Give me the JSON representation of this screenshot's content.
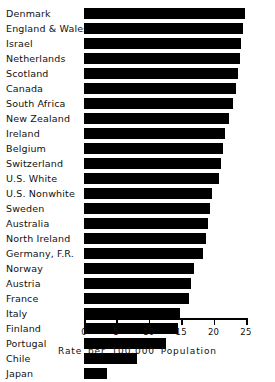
{
  "chart_data": {
    "type": "bar",
    "orientation": "horizontal",
    "title": "",
    "subtitle": "",
    "xlabel": "Rate per 100,000 Population",
    "ylabel": "",
    "xlim": [
      0,
      25
    ],
    "xticks": [
      0,
      5,
      10,
      15,
      20,
      25
    ],
    "xtick_labels": [
      "0",
      "5",
      "10",
      "15",
      "20",
      "25"
    ],
    "grid": false,
    "legend": false,
    "bar_color": "#000000",
    "background_color": "#ffffff",
    "categories": [
      "Denmark",
      "England & Wales",
      "Israel",
      "Netherlands",
      "Scotland",
      "Canada",
      "South  Africa",
      "New  Zealand",
      "Ireland",
      "Belgium",
      "Switzerland",
      "U.S. White",
      "U.S.  Nonwhite",
      "Sweden",
      "Australia",
      "North  Ireland",
      "Germany,  F.R.",
      "Norway",
      "Austria",
      "France",
      "Italy",
      "Finland",
      "Portugal",
      "Chile",
      "Japan"
    ],
    "values": [
      24.8,
      24.5,
      24.2,
      24.0,
      23.8,
      23.4,
      23.0,
      22.3,
      21.8,
      21.5,
      21.2,
      20.8,
      19.8,
      19.5,
      19.2,
      18.8,
      18.4,
      17.0,
      16.5,
      16.2,
      14.8,
      14.5,
      12.6,
      8.2,
      3.6
    ]
  }
}
